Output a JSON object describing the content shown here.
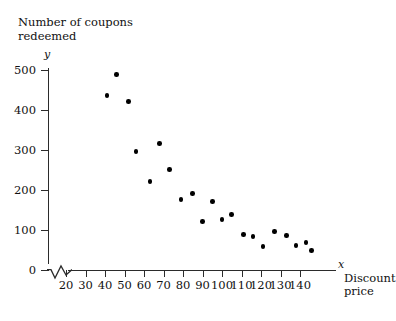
{
  "chart_data": {
    "type": "scatter",
    "title": "Number of coupons\nredeemed",
    "xlabel": "Discount\nprice",
    "ylabel": "Number of coupons redeemed",
    "x_axis_letter": "x",
    "y_axis_letter": "y",
    "xlim": [
      15,
      148
    ],
    "ylim": [
      0,
      520
    ],
    "grid": false,
    "legend": null,
    "axis_break_x": true,
    "xticks": [
      20,
      30,
      40,
      50,
      60,
      70,
      80,
      90,
      100,
      110,
      120,
      130,
      140
    ],
    "xtick_labels": [
      "20",
      "30",
      "40",
      "50",
      "60",
      "70",
      "80",
      "90",
      "100",
      "110",
      "120",
      "130",
      "140"
    ],
    "yticks": [
      0,
      100,
      200,
      300,
      400,
      500
    ],
    "ytick_labels": [
      "0",
      "100",
      "200",
      "300",
      "400",
      "500"
    ],
    "points": [
      {
        "x": 41,
        "y": 435
      },
      {
        "x": 46,
        "y": 488
      },
      {
        "x": 52,
        "y": 420
      },
      {
        "x": 56,
        "y": 295
      },
      {
        "x": 63,
        "y": 220
      },
      {
        "x": 68,
        "y": 315
      },
      {
        "x": 73,
        "y": 250
      },
      {
        "x": 79,
        "y": 175
      },
      {
        "x": 85,
        "y": 190
      },
      {
        "x": 90,
        "y": 120
      },
      {
        "x": 95,
        "y": 170
      },
      {
        "x": 100,
        "y": 125
      },
      {
        "x": 105,
        "y": 138
      },
      {
        "x": 111,
        "y": 88
      },
      {
        "x": 116,
        "y": 83
      },
      {
        "x": 121,
        "y": 58
      },
      {
        "x": 127,
        "y": 95
      },
      {
        "x": 133,
        "y": 85
      },
      {
        "x": 138,
        "y": 60
      },
      {
        "x": 143,
        "y": 68
      },
      {
        "x": 146,
        "y": 48
      }
    ],
    "colors": {
      "marker": "#000000",
      "axis": "#2b2b2b",
      "text": "#111111",
      "background": "#ffffff"
    }
  }
}
